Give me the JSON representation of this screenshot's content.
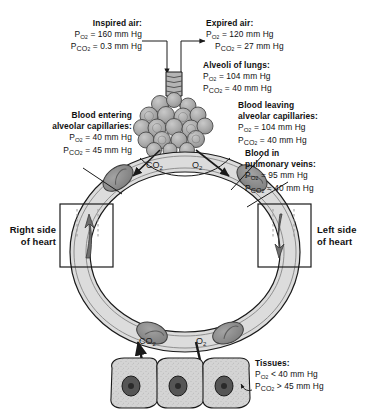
{
  "diagram": {
    "colors": {
      "alveoli_fill": "#a8a8a8",
      "vessel_fill": "#dcdcdc",
      "rbc_fill": "#8a8a8a",
      "tissue_fill": "#cfcfcf",
      "stroke": "#1a1a1a",
      "background": "#ffffff"
    }
  },
  "labels": {
    "inspired_air": {
      "heading": "Inspired air:",
      "po2": "= 160 mm Hg",
      "pco2": "= 0.3 mm Hg"
    },
    "expired_air": {
      "heading": "Expired air:",
      "po2": "= 120 mm Hg",
      "pco2": "= 27 mm Hg"
    },
    "alveoli": {
      "heading": "Alveoli of lungs:",
      "po2": "= 104 mm Hg",
      "pco2": "= 40 mm Hg"
    },
    "blood_entering": {
      "heading_1": "Blood entering",
      "heading_2": "alveolar capillaries:",
      "po2": "= 40 mm Hg",
      "pco2": "= 45 mm Hg"
    },
    "blood_leaving": {
      "heading_1": "Blood leaving",
      "heading_2": "alveolar capillaries:",
      "po2": "= 104 mm Hg",
      "pco2": "= 40 mm Hg"
    },
    "pulmonary_veins": {
      "heading_1": "Blood in",
      "heading_2": "pulmonary veins:",
      "po2": "= 95 mm Hg",
      "pco2": "= 40 mm Hg"
    },
    "tissues": {
      "heading": "Tissues:",
      "po2": "< 40 mm Hg",
      "pco2": "> 45 mm Hg"
    },
    "right_heart": {
      "line_1": "Right side",
      "line_2": "of heart"
    },
    "left_heart": {
      "line_1": "Left side",
      "line_2": "of heart"
    },
    "symbols": {
      "p": "P",
      "o2_sub": "O",
      "co2_sub": "CO",
      "two": "2"
    },
    "gas_lung_co2": "CO",
    "gas_lung_o2": "O",
    "gas_tissue_co2": "CO",
    "gas_tissue_o2": "O"
  }
}
